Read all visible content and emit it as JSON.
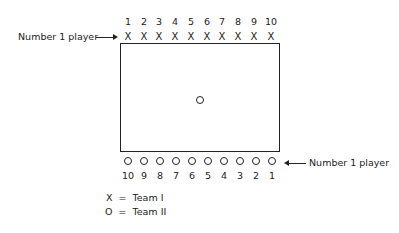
{
  "diagram": {
    "team1": {
      "numbers": [
        "1",
        "2",
        "3",
        "4",
        "5",
        "6",
        "7",
        "8",
        "9",
        "10"
      ],
      "symbol": "X",
      "pointer_label": "Number 1 player"
    },
    "team2": {
      "numbers": [
        "10",
        "9",
        "8",
        "7",
        "6",
        "5",
        "4",
        "3",
        "2",
        "1"
      ],
      "symbol": "O",
      "pointer_label": "Number 1 player"
    },
    "center_symbol": "O",
    "legend": [
      {
        "symbol": "X",
        "eq": "=",
        "text": "Team I"
      },
      {
        "symbol": "O",
        "eq": "=",
        "text": "Team II"
      }
    ]
  }
}
